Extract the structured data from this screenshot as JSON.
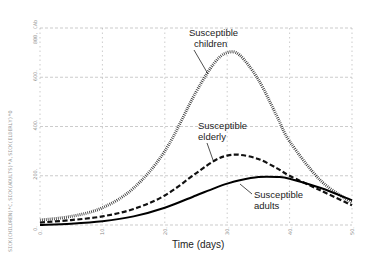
{
  "chart_data": {
    "type": "line",
    "title": "",
    "xlabel": "Time (days)",
    "ylabel": "SICK(CHILDREN)*C,SICK(ADULTS)*A,SICK(ELDERLY)*O",
    "xlim": [
      0,
      50
    ],
    "ylim": [
      0,
      800
    ],
    "x_ticks": [
      "0.",
      "10.",
      "20.",
      "30.",
      "40.",
      "50."
    ],
    "y_ticks": [
      "0.",
      "200.",
      "400.",
      "600.",
      "800."
    ],
    "y_top_label": "800, CAb",
    "grid": true,
    "x": [
      0,
      5,
      10,
      15,
      20,
      25,
      28,
      30,
      32,
      35,
      38,
      40,
      45,
      50
    ],
    "series": [
      {
        "name": "Susceptible children",
        "style": "dotted",
        "values": [
          20,
          35,
          70,
          150,
          300,
          540,
          660,
          700,
          690,
          590,
          440,
          340,
          180,
          90
        ]
      },
      {
        "name": "Susceptible elderly",
        "style": "dashed",
        "values": [
          10,
          20,
          35,
          65,
          120,
          210,
          262,
          282,
          285,
          268,
          230,
          200,
          140,
          80
        ]
      },
      {
        "name": "Susceptible adults",
        "style": "solid",
        "values": [
          0,
          5,
          15,
          35,
          70,
          120,
          150,
          168,
          182,
          195,
          195,
          188,
          150,
          100
        ]
      }
    ],
    "annotations": [
      {
        "text_line1": "Susceptible",
        "text_line2": "children"
      },
      {
        "text_line1": "Susceptible",
        "text_line2": "elderly"
      },
      {
        "text_line1": "Susceptible",
        "text_line2": "adults"
      }
    ]
  }
}
